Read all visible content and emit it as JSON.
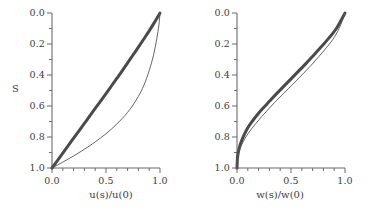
{
  "figure": {
    "background": "#ffffff",
    "line_color_thick": "#4a4a4a",
    "line_color_thin": "#555555",
    "axis_color": "#6b6b6b",
    "text_color": "#3d3d3d"
  },
  "chart_data": [
    {
      "type": "line",
      "panel": "left",
      "title": "",
      "xlabel": "u(s)/u(0)",
      "ylabel": "S",
      "xlim": [
        0.0,
        1.0
      ],
      "ylim": [
        1.0,
        0.0
      ],
      "y_axis_inverted": true,
      "grid": false,
      "legend": "none",
      "xticks": [
        0.0,
        0.5,
        1.0
      ],
      "xticklabels": [
        "0.0",
        "0.5",
        "1.0"
      ],
      "xminortick_step": 0.1,
      "yticks": [
        0.0,
        0.2,
        0.4,
        0.6,
        0.8,
        1.0
      ],
      "yticklabels": [
        "0.0",
        "0.2",
        "0.4",
        "0.6",
        "0.8",
        "1.0"
      ],
      "yminortick_step": 0.1,
      "series": [
        {
          "name": "thick-curve",
          "style": "thick",
          "linewidth": 3.0,
          "color": "#4a4a4a",
          "x": [
            0.0,
            0.05,
            0.1,
            0.15,
            0.2,
            0.25,
            0.3,
            0.35,
            0.4,
            0.45,
            0.5,
            0.55,
            0.6,
            0.65,
            0.7,
            0.75,
            0.8,
            0.85,
            0.9,
            0.95,
            1.0
          ],
          "y": [
            1.0,
            0.952,
            0.904,
            0.856,
            0.808,
            0.76,
            0.712,
            0.664,
            0.616,
            0.568,
            0.52,
            0.471,
            0.422,
            0.373,
            0.322,
            0.271,
            0.22,
            0.168,
            0.115,
            0.059,
            0.0
          ]
        },
        {
          "name": "thin-curve",
          "style": "thin",
          "linewidth": 0.9,
          "color": "#555555",
          "x": [
            0.0,
            0.05,
            0.1,
            0.15,
            0.2,
            0.25,
            0.3,
            0.35,
            0.4,
            0.45,
            0.5,
            0.55,
            0.6,
            0.65,
            0.7,
            0.75,
            0.8,
            0.85,
            0.9,
            0.94,
            0.97,
            0.99,
            1.0
          ],
          "y": [
            1.0,
            0.981,
            0.962,
            0.942,
            0.922,
            0.901,
            0.879,
            0.856,
            0.832,
            0.806,
            0.779,
            0.749,
            0.717,
            0.681,
            0.641,
            0.594,
            0.538,
            0.468,
            0.372,
            0.272,
            0.167,
            0.077,
            0.0
          ]
        }
      ]
    },
    {
      "type": "line",
      "panel": "right",
      "title": "",
      "xlabel": "w(s)/w(0)",
      "ylabel": "",
      "xlim": [
        0.0,
        1.0
      ],
      "ylim": [
        1.0,
        0.0
      ],
      "y_axis_inverted": true,
      "grid": false,
      "legend": "none",
      "xticks": [
        0.0,
        0.5,
        1.0
      ],
      "xticklabels": [
        "0.0",
        "0.5",
        "1.0"
      ],
      "xminortick_step": 0.1,
      "yticks": [
        0.0,
        0.2,
        0.4,
        0.6,
        0.8,
        1.0
      ],
      "yticklabels": [
        "0.0",
        "0.2",
        "0.4",
        "0.6",
        "0.8",
        "1.0"
      ],
      "yminortick_step": 0.1,
      "series": [
        {
          "name": "thick-curve",
          "style": "thick",
          "linewidth": 3.0,
          "color": "#4a4a4a",
          "x": [
            0.0,
            0.004,
            0.012,
            0.025,
            0.045,
            0.07,
            0.1,
            0.14,
            0.19,
            0.24,
            0.3,
            0.36,
            0.43,
            0.5,
            0.57,
            0.64,
            0.71,
            0.78,
            0.85,
            0.92,
            1.0
          ],
          "y": [
            1.0,
            0.94,
            0.9,
            0.86,
            0.82,
            0.78,
            0.74,
            0.7,
            0.655,
            0.615,
            0.57,
            0.525,
            0.475,
            0.425,
            0.375,
            0.325,
            0.272,
            0.218,
            0.162,
            0.1,
            0.0
          ]
        },
        {
          "name": "thin-curve",
          "style": "thin",
          "linewidth": 0.9,
          "color": "#555555",
          "x": [
            0.0,
            0.004,
            0.013,
            0.03,
            0.055,
            0.088,
            0.128,
            0.175,
            0.228,
            0.285,
            0.345,
            0.41,
            0.478,
            0.548,
            0.618,
            0.688,
            0.757,
            0.824,
            0.888,
            0.947,
            1.0
          ],
          "y": [
            1.0,
            0.945,
            0.91,
            0.872,
            0.833,
            0.793,
            0.753,
            0.712,
            0.669,
            0.625,
            0.58,
            0.534,
            0.487,
            0.438,
            0.388,
            0.336,
            0.282,
            0.227,
            0.17,
            0.098,
            0.0
          ]
        }
      ]
    }
  ]
}
